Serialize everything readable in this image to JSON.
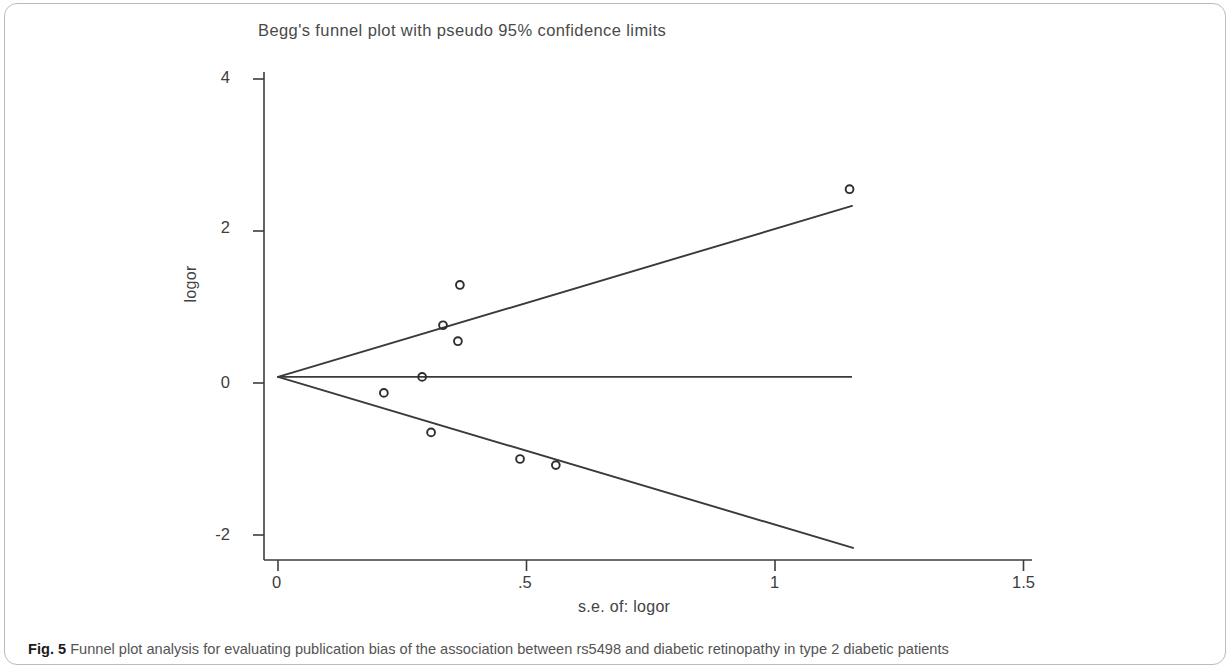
{
  "figure": {
    "caption_lead": "Fig. 5",
    "caption_text": "Funnel plot analysis for evaluating publication bias of the association between rs5498 and diabetic retinopathy in type 2 diabetic patients"
  },
  "colors": {
    "line": "#3a3a3a",
    "axis": "#3d3d3d",
    "marker": "#2e2e2e",
    "frame": "#b9bcbe",
    "title_text": "#4a4a4a",
    "caption_text": "#545454"
  },
  "chart_data": {
    "type": "scatter",
    "title": "Begg's funnel plot with pseudo 95% confidence limits",
    "xlabel": "s.e. of: logor",
    "ylabel": "logor",
    "xlim": [
      -0.04,
      1.6
    ],
    "ylim": [
      -2.6,
      4.35
    ],
    "xticks": [
      0,
      0.5,
      1,
      1.5
    ],
    "xtick_labels": [
      "0",
      ".5",
      "1",
      "1.5"
    ],
    "yticks": [
      -2,
      0,
      2,
      4
    ],
    "ytick_labels": [
      "-2",
      "0",
      "2",
      "4"
    ],
    "grid": false,
    "legend": "none",
    "marker_style": "open-circle",
    "points": [
      {
        "se": 0.213,
        "logor": -0.13
      },
      {
        "se": 0.29,
        "logor": 0.08
      },
      {
        "se": 0.308,
        "logor": -0.65
      },
      {
        "se": 0.332,
        "logor": 0.76
      },
      {
        "se": 0.362,
        "logor": 0.55
      },
      {
        "se": 0.366,
        "logor": 1.29
      },
      {
        "se": 0.487,
        "logor": -1.0
      },
      {
        "se": 0.559,
        "logor": -1.08
      },
      {
        "se": 1.15,
        "logor": 2.55
      }
    ],
    "pooled_effect": 0.08,
    "pooled_line": {
      "x_start": 0.0,
      "x_end": 1.155,
      "y": 0.08
    },
    "ci_upper_line": {
      "x_start": 0.0,
      "x_end": 1.155,
      "y_start": 0.08,
      "y_end": 2.33
    },
    "ci_lower_line": {
      "x_start": 0.0,
      "x_end": 1.157,
      "y_start": 0.08,
      "y_end": -2.17
    }
  }
}
